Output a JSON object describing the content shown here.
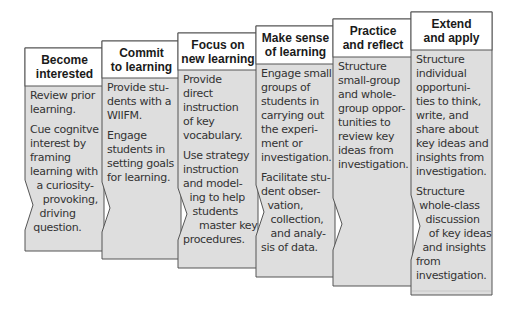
{
  "diagram": {
    "colors": {
      "header_fill": "#ffffff",
      "body_fill": "#dedede",
      "border": "#555555",
      "text": "#333333"
    },
    "columns": [
      {
        "title": "Become\ninterested",
        "paragraphs": [
          "Review prior\nlearning.",
          "Cue cognitve\ninterest by\nframing\nlearning with\n  a curiosity-\n    provoking,\n   driving\n question."
        ]
      },
      {
        "title": "Commit\nto learning",
        "paragraphs": [
          "Provide stu-\ndents with a\nWIIFM.",
          "Engage\nstudents in\nsetting goals\nfor learning."
        ]
      },
      {
        "title": "Focus on\nnew learning",
        "paragraphs": [
          "Provide\ndirect\ninstruction\nof key\nvocabulary.",
          "Use strategy\ninstruction\nand model-\n  ing to help\n   students\n     master key\nprocedures."
        ]
      },
      {
        "title": "Make sense\nof learning",
        "paragraphs": [
          "Engage small\ngroups of\nstudents in\ncarrying out\nthe experi-\nment or\ninvestigation.",
          "Facilitate stu-\ndent obser-\n  vation,\n   collection,\n   and analy-\nsis of data."
        ]
      },
      {
        "title": "Practice\nand reflect",
        "paragraphs": [
          "Structure\nsmall-group\nand whole-\ngroup oppor-\ntunities to\nreview key\nideas from\ninvestigation."
        ]
      },
      {
        "title": "Extend\nand apply",
        "paragraphs": [
          "Structure\nindividual\nopportuni-\nties to think,\nwrite, and\nshare about\nkey ideas and\ninsights from\ninvestigation.",
          "Structure\n whole-class\n   discussion\n    of key ideas\n  and insights\nfrom\ninvestigation."
        ]
      }
    ]
  }
}
